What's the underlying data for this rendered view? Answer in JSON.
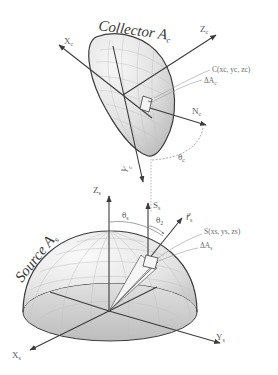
{
  "diagram": {
    "collector": {
      "title": "Collector A",
      "title_sub": "c",
      "axes": {
        "x": "X",
        "x_sub": "c",
        "y": "Y",
        "y_sub": "c",
        "z": "Z",
        "z_sub": "c"
      },
      "point_label": "C(x",
      "point_label_full": "C(xc, yc, zc)",
      "area_label": "ΔA",
      "area_sub": "c",
      "normal_label": "N",
      "normal_sub": "c",
      "angle_label": "θ",
      "angle_sub": "c"
    },
    "source": {
      "title": "Source A",
      "title_sub": "s",
      "axes": {
        "x": "X",
        "x_sub": "s",
        "y": "Y",
        "y_sub": "s",
        "z": "Z",
        "z_sub": "s"
      },
      "point_label_full": "S(xs, ys, zs)",
      "area_label": "ΔA",
      "area_sub": "s",
      "normal_label": "S",
      "normal_sub": "s",
      "angle_theta_s": "θ",
      "angle_theta_s_sub": "s",
      "angle_theta_2": "θ",
      "angle_theta_2_sub": "2",
      "ray_label": "r⃗",
      "ray_sub": "s"
    },
    "colors": {
      "line": "#3c3c3c",
      "shade_light": "#f2f2f2",
      "shade_dark": "#c8c8c8",
      "grid": "#bdbdbd",
      "text": "#4a4a4a"
    }
  }
}
